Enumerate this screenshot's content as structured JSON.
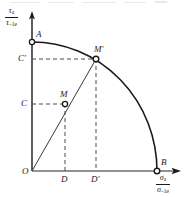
{
  "figure": {
    "kind": "fatigue-limit-ellipse-diagram",
    "background_color": "#ffffff",
    "ink_color": "#1a1a1a"
  },
  "axes": {
    "y": {
      "name": "tau-axis",
      "numerator": "τ",
      "numerator_sub": "a",
      "denominator": "τ",
      "denominator_sub": "–1e",
      "origin_px": [
        32,
        171
      ],
      "tip_px": [
        32,
        13
      ]
    },
    "x": {
      "name": "sigma-axis",
      "numerator": "σ",
      "numerator_sub": "a",
      "denominator": "σ",
      "denominator_sub": "–1e",
      "origin_px": [
        32,
        171
      ],
      "tip_px": [
        180,
        171
      ]
    }
  },
  "points": {
    "O": {
      "label": "O",
      "x_px": 32,
      "y_px": 171,
      "marker": false
    },
    "A": {
      "label": "A",
      "x_px": 32,
      "y_px": 42,
      "marker": true
    },
    "B": {
      "label": "B",
      "x_px": 157,
      "y_px": 171,
      "marker": true
    },
    "M": {
      "label": "M",
      "x_px": 65,
      "y_px": 104,
      "marker": true
    },
    "Mprime": {
      "label": "M′",
      "x_px": 96,
      "y_px": 59,
      "marker": true
    },
    "C": {
      "label": "C",
      "x_px": 32,
      "y_px": 104
    },
    "Cprime": {
      "label": "C′",
      "x_px": 32,
      "y_px": 59
    },
    "D": {
      "label": "D",
      "x_px": 65,
      "y_px": 171
    },
    "Dprime": {
      "label": "D′",
      "x_px": 96,
      "y_px": 171
    }
  },
  "curve": {
    "name": "failure-envelope-ellipse",
    "type": "elliptical-arc",
    "from": "A",
    "to": "B",
    "semi_axis_x_px": 125,
    "semi_axis_y_px": 129
  },
  "ray": {
    "name": "loading-path-ray",
    "from": "O",
    "through": "M",
    "to": "Mprime"
  },
  "dashed_lines": [
    {
      "name": "C-to-M",
      "from": [
        32,
        104
      ],
      "to": [
        65,
        104
      ]
    },
    {
      "name": "Cprime-to-Mprime",
      "from": [
        32,
        59
      ],
      "to": [
        96,
        59
      ]
    },
    {
      "name": "M-to-D",
      "from": [
        65,
        104
      ],
      "to": [
        65,
        171
      ]
    },
    {
      "name": "Mprime-to-Dprime",
      "from": [
        96,
        59
      ],
      "to": [
        96,
        171
      ]
    }
  ]
}
